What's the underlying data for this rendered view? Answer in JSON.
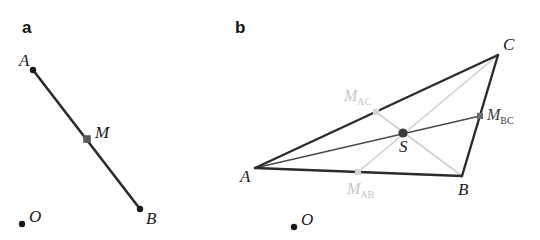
{
  "figure": {
    "background_color": "#ffffff",
    "width": 540,
    "height": 240,
    "panels": [
      {
        "id": "a",
        "letter": "a",
        "letter_pos": [
          22,
          33
        ],
        "description": "segment AB with midpoint M and origin O",
        "colors": {
          "segment": "#2b2b2b",
          "point": "#1a1a1a",
          "midpoint_marker": "#555555",
          "label": "#1a1a1a"
        },
        "points": [
          {
            "name": "A",
            "label": "A",
            "x": 33,
            "y": 70,
            "marker": "dot",
            "label_x": 19,
            "label_y": 66,
            "label_color": "#1a1a1a"
          },
          {
            "name": "M",
            "label": "M",
            "x": 87,
            "y": 139,
            "marker": "square",
            "label_x": 95,
            "label_y": 138,
            "label_color": "#555555"
          },
          {
            "name": "B",
            "label": "B",
            "x": 140,
            "y": 209,
            "marker": "dot",
            "label_x": 146,
            "label_y": 224,
            "label_color": "#1a1a1a"
          },
          {
            "name": "O",
            "label": "O",
            "x": 22,
            "y": 224,
            "marker": "dot",
            "label_x": 29,
            "label_y": 222,
            "label_color": "#1a1a1a"
          }
        ],
        "segments": [
          {
            "name": "AB",
            "from": "A",
            "to": "B",
            "color": "#2b2b2b",
            "width": 2.6
          }
        ]
      },
      {
        "id": "b",
        "letter": "b",
        "letter_pos": [
          235,
          33
        ],
        "description": "triangle ABC with side midpoints M_AB, M_AC, M_BC, medians and centroid S, plus origin O",
        "colors": {
          "triangle_edge": "#2b2b2b",
          "median_dark": "#4a4a4a",
          "median_light": "#cfcfcf",
          "centroid": "#3a3a3a",
          "label": "#1a1a1a",
          "label_light": "#c6c6c6",
          "label_dark": "#3d3d3d"
        },
        "points": [
          {
            "name": "A",
            "label": "A",
            "x": 255,
            "y": 168,
            "marker": "none",
            "label_x": 240,
            "label_y": 182,
            "label_color": "#1a1a1a"
          },
          {
            "name": "B",
            "label": "B",
            "x": 462,
            "y": 176,
            "marker": "none",
            "label_x": 458,
            "label_y": 195,
            "label_color": "#1a1a1a"
          },
          {
            "name": "C",
            "label": "C",
            "x": 498,
            "y": 55,
            "marker": "none",
            "label_x": 503,
            "label_y": 50,
            "label_color": "#1a1a1a"
          },
          {
            "name": "S",
            "label": "S",
            "x": 403,
            "y": 133,
            "marker": "dot",
            "label_x": 399,
            "label_y": 152,
            "label_color": "#1a1a1a"
          }
        ],
        "midpoints": [
          {
            "name": "M_AC",
            "label": "M",
            "subscript": "AC",
            "x": 376,
            "y": 112,
            "label_x": 344,
            "label_y": 100,
            "color": "#cfcfcf",
            "label_color": "#c6c6c6"
          },
          {
            "name": "M_BC",
            "label": "M",
            "subscript": "BC",
            "x": 480,
            "y": 116,
            "label_x": 487,
            "label_y": 119,
            "color": "#4a4a4a",
            "label_color": "#3d3d3d"
          },
          {
            "name": "M_AB",
            "label": "M",
            "subscript": "AB",
            "x": 358,
            "y": 172,
            "label_x": 347,
            "label_y": 193,
            "color": "#cfcfcf",
            "label_color": "#c6c6c6"
          }
        ],
        "origin": {
          "name": "O",
          "label": "O",
          "x": 294,
          "y": 227,
          "label_x": 301,
          "label_y": 225
        },
        "edges": [
          {
            "name": "AB",
            "from": "A",
            "to": "B",
            "color": "#2b2b2b",
            "width": 2.4
          },
          {
            "name": "AC",
            "from": "A",
            "to": "C",
            "color": "#2b2b2b",
            "width": 2.4
          },
          {
            "name": "BC",
            "from": "B",
            "to": "C",
            "color": "#2b2b2b",
            "width": 2.4
          }
        ],
        "medians": [
          {
            "name": "median-A-MBC",
            "from": "A",
            "to": "M_BC",
            "color": "#4a4a4a",
            "width": 1.5
          },
          {
            "name": "median-B-MAC",
            "from": "B",
            "to": "M_AC",
            "color": "#cfcfcf",
            "width": 1.5
          },
          {
            "name": "median-C-MAB",
            "from": "C",
            "to": "M_AB",
            "color": "#cfcfcf",
            "width": 1.5
          }
        ]
      }
    ]
  }
}
